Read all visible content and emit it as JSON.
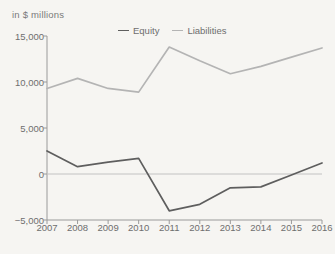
{
  "chart_data": {
    "type": "line",
    "title": "",
    "subtitle": "",
    "axis_caption": "in $ millions",
    "xlabel": "",
    "ylabel": "",
    "categories": [
      "2007",
      "2008",
      "2009",
      "2010",
      "2011",
      "2012",
      "2013",
      "2014",
      "2015",
      "2016"
    ],
    "series": [
      {
        "name": "Equity",
        "color": "#5e5e5e",
        "values": [
          2500,
          800,
          1300,
          1700,
          -4000,
          -3300,
          -1500,
          -1400,
          -100,
          1200
        ]
      },
      {
        "name": "Liabilities",
        "color": "#b4b4b4",
        "values": [
          9300,
          10400,
          9300,
          8900,
          13800,
          12300,
          10900,
          11700,
          12700,
          13700
        ]
      }
    ],
    "ylim": [
      -5000,
      15000
    ],
    "yticks": [
      15000,
      10000,
      5000,
      0,
      -5000
    ],
    "ytick_labels": [
      "15,000",
      "10,000",
      "5,000",
      "0",
      "-5,000"
    ],
    "grid": false,
    "zero_line": true,
    "legend_position": "top-center",
    "background_color": "#f6f5f2"
  },
  "legend": {
    "entries": [
      {
        "label": "Equity"
      },
      {
        "label": "Liabilities"
      }
    ]
  }
}
